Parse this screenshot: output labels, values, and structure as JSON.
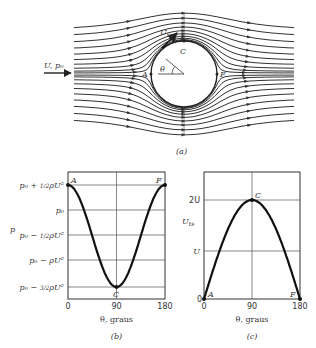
{
  "figure_a": {
    "caption": "(a)",
    "inflow_label": "U, p₀",
    "velocity_label": "U",
    "velocity_sub": "ts",
    "angle_label": "θ",
    "points": {
      "A": "A",
      "C": "C",
      "F": "F"
    },
    "cylinder": {
      "cx": 184,
      "cy": 74,
      "r": 33
    },
    "streamlines": {
      "x_start": 74,
      "x_end": 294,
      "scale_px_per_R": 33,
      "psi_values": [
        -1.3,
        -1.1,
        -0.9,
        -0.72,
        -0.55,
        -0.4,
        -0.27,
        -0.16,
        -0.08,
        -0.03,
        0.03,
        0.08,
        0.16,
        0.27,
        0.4,
        0.55,
        0.72,
        0.9,
        1.1,
        1.3
      ]
    }
  },
  "figure_b": {
    "caption": "(b)",
    "y_axis_label": "p",
    "x_axis_label": "θ, graus",
    "x_ticks": [
      "0",
      "90",
      "180"
    ],
    "y_ticks": [
      {
        "main": "p₀ + ",
        "frac": "1/2",
        "tail": "ρU²"
      },
      {
        "main": "p₀",
        "frac": "",
        "tail": ""
      },
      {
        "main": "p₀ − ",
        "frac": "1/2",
        "tail": "ρU²"
      },
      {
        "main": "p₀ − ρU²",
        "frac": "",
        "tail": ""
      },
      {
        "main": "p₀ − ",
        "frac": "3/2",
        "tail": "ρU²"
      }
    ],
    "points": {
      "A": "A",
      "C": "C",
      "F": "F"
    }
  },
  "figure_c": {
    "caption": "(c)",
    "y_axis_label": "U",
    "y_axis_sub": "ts",
    "x_axis_label": "θ, graus",
    "x_ticks": [
      "0",
      "90",
      "180"
    ],
    "y_ticks": [
      "2U",
      "U",
      "0"
    ],
    "points": {
      "A": "A",
      "C": "C",
      "F": "F"
    }
  },
  "chart_data": [
    {
      "type": "line",
      "title": "(b) Surface pressure on cylinder",
      "xlabel": "θ, graus",
      "ylabel": "p",
      "x": [
        0,
        15,
        30,
        45,
        60,
        75,
        90,
        105,
        120,
        135,
        150,
        165,
        180
      ],
      "series": [
        {
          "name": "(p − p₀)/(½ρU²)",
          "values": [
            1.0,
            0.732,
            0.0,
            -1.0,
            -2.0,
            -2.732,
            -3.0,
            -2.732,
            -2.0,
            -1.0,
            0.0,
            0.732,
            1.0
          ]
        }
      ],
      "xlim": [
        0,
        180
      ],
      "ylim": [
        -3,
        1
      ],
      "grid": true,
      "annotations": [
        "A at (0, p₀+½ρU²)",
        "C at (90, p₀−³⁄₂ρU²)",
        "F at (180, p₀+½ρU²)"
      ]
    },
    {
      "type": "line",
      "title": "(c) Surface velocity on cylinder",
      "xlabel": "θ, graus",
      "ylabel": "U_ts",
      "x": [
        0,
        15,
        30,
        45,
        60,
        75,
        90,
        105,
        120,
        135,
        150,
        165,
        180
      ],
      "series": [
        {
          "name": "U_ts / U",
          "values": [
            0,
            0.518,
            1.0,
            1.414,
            1.732,
            1.932,
            2.0,
            1.932,
            1.732,
            1.414,
            1.0,
            0.518,
            0
          ]
        }
      ],
      "xlim": [
        0,
        180
      ],
      "ylim": [
        0,
        2.5
      ],
      "grid": true,
      "annotations": [
        "A at (0, 0)",
        "C at (90, 2U)",
        "F at (180, 0)"
      ]
    }
  ]
}
